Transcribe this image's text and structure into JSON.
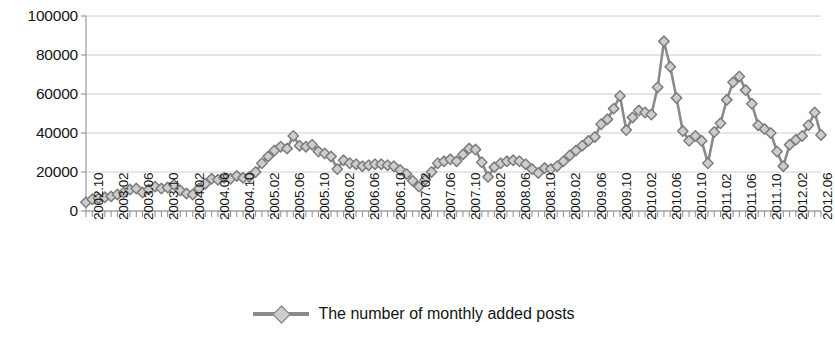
{
  "chart_data": {
    "type": "line",
    "title": "",
    "xlabel": "",
    "ylabel": "",
    "ylim": [
      0,
      100000
    ],
    "yticks": [
      0,
      20000,
      40000,
      60000,
      80000,
      100000
    ],
    "ytick_labels": [
      "0",
      "20000",
      "40000",
      "60000",
      "80000",
      "100000"
    ],
    "grid": true,
    "legend_position": "bottom",
    "series": [
      {
        "name": "The number of monthly added posts",
        "marker": "diamond",
        "line_color": "#8a8a8a",
        "marker_fill": "#cdcdcd",
        "marker_edge": "#7d7d7d",
        "x": [
          "2002.10",
          "2002.11",
          "2002.12",
          "2003.01",
          "2003.02",
          "2003.03",
          "2003.04",
          "2003.05",
          "2003.06",
          "2003.07",
          "2003.08",
          "2003.09",
          "2003.10",
          "2003.11",
          "2003.12",
          "2004.01",
          "2004.02",
          "2004.03",
          "2004.04",
          "2004.05",
          "2004.06",
          "2004.07",
          "2004.08",
          "2004.09",
          "2004.10",
          "2004.11",
          "2004.12",
          "2005.01",
          "2005.02",
          "2005.03",
          "2005.04",
          "2005.05",
          "2005.06",
          "2005.07",
          "2005.08",
          "2005.09",
          "2005.10",
          "2005.11",
          "2005.12",
          "2006.01",
          "2006.02",
          "2006.03",
          "2006.04",
          "2006.05",
          "2006.06",
          "2006.07",
          "2006.08",
          "2006.09",
          "2006.10",
          "2006.11",
          "2006.12",
          "2007.01",
          "2007.02",
          "2007.03",
          "2007.04",
          "2007.05",
          "2007.06",
          "2007.07",
          "2007.08",
          "2007.09",
          "2007.10",
          "2007.11",
          "2007.12",
          "2008.01",
          "2008.02",
          "2008.03",
          "2008.04",
          "2008.05",
          "2008.06",
          "2008.07",
          "2008.08",
          "2008.09",
          "2008.10",
          "2008.11",
          "2008.12",
          "2009.01",
          "2009.02",
          "2009.03",
          "2009.04",
          "2009.05",
          "2009.06",
          "2009.07",
          "2009.08",
          "2009.09",
          "2009.10",
          "2009.11",
          "2009.12",
          "2010.01",
          "2010.02",
          "2010.03",
          "2010.04",
          "2010.05",
          "2010.06",
          "2010.07",
          "2010.08",
          "2010.09",
          "2010.10",
          "2010.11",
          "2010.12",
          "2011.01",
          "2011.02",
          "2011.03",
          "2011.04",
          "2011.05",
          "2011.06",
          "2011.07",
          "2011.08",
          "2011.09",
          "2011.10",
          "2011.11",
          "2011.12",
          "2012.01",
          "2012.02",
          "2012.03",
          "2012.04",
          "2012.05",
          "2012.06",
          "2012.07"
        ],
        "values": [
          4500,
          6000,
          6500,
          7000,
          7500,
          8500,
          9500,
          11000,
          11500,
          9500,
          11000,
          12500,
          11500,
          12000,
          13500,
          10500,
          9000,
          8500,
          11500,
          14000,
          16500,
          16000,
          17000,
          16500,
          18000,
          17000,
          17500,
          20000,
          24500,
          28000,
          31000,
          33000,
          32000,
          38500,
          33500,
          33000,
          34000,
          30500,
          29500,
          28000,
          21500,
          26000,
          24500,
          24000,
          23000,
          23500,
          24000,
          24000,
          23500,
          23000,
          21000,
          19000,
          15500,
          12500,
          16000,
          20000,
          24500,
          25500,
          26500,
          25500,
          29000,
          32000,
          31500,
          25000,
          17500,
          22500,
          24500,
          25500,
          26000,
          25500,
          24000,
          21500,
          19500,
          22000,
          21500,
          23000,
          25500,
          28500,
          31000,
          33500,
          36000,
          38000,
          44500,
          47000,
          52500,
          59000,
          41500,
          48000,
          51500,
          50500,
          49500,
          63500,
          87000,
          74000,
          58000,
          41000,
          36000,
          38500,
          36000,
          24500,
          40500,
          45000,
          57000,
          66000,
          69000,
          62000,
          55000,
          44000,
          42000,
          40000,
          30500,
          23000,
          34000,
          36500,
          38500,
          44000,
          50500,
          39000
        ]
      }
    ],
    "xtick_labels": [
      "2002.10",
      "2003.02",
      "2003.06",
      "2003.10",
      "2004.02",
      "2004.06",
      "2004.10",
      "2005.02",
      "2005.06",
      "2005.10",
      "2006.02",
      "2006.06",
      "2006.10",
      "2007.02",
      "2007.06",
      "2007.10",
      "2008.02",
      "2008.06",
      "2008.10",
      "2009.02",
      "2009.06",
      "2009.10",
      "2010.02",
      "2010.06",
      "2010.10",
      "2011.02",
      "2011.06",
      "2011.10",
      "2012.02",
      "2012.06"
    ]
  },
  "legend": {
    "label": "The number of monthly added posts"
  }
}
